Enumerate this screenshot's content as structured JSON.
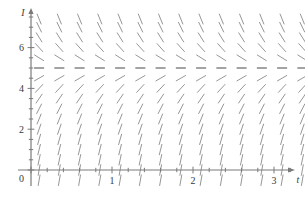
{
  "figure": {
    "name": "slope-field-plot",
    "background_color": "#ffffff",
    "line_color": "#6f6f6f",
    "axis_color": "#7a7a7a",
    "text_color": "#3a3a3a"
  },
  "axes": {
    "x_label": "t",
    "y_label": "I",
    "x_tick_labels": [
      "0",
      "1",
      "2",
      "3"
    ],
    "x_tick_values": [
      0,
      1,
      2,
      3
    ],
    "y_tick_labels": [
      "0",
      "2",
      "4",
      "6"
    ],
    "y_tick_values": [
      0,
      2,
      4,
      6
    ],
    "origin_label": "0",
    "x_minor_tick_count_per_unit": 5,
    "y_minor_tick_count_per_unit": 2
  },
  "chart_data": {
    "type": "scatter",
    "title": "",
    "subtitle": "",
    "xlabel": "t",
    "ylabel": "I",
    "xlim": [
      -0.2,
      3.45
    ],
    "ylim": [
      -0.65,
      7.6
    ],
    "grid": false,
    "legend": "none",
    "equilibrium_value": 5,
    "slope_marks_note": "Each mark is a short line segment centered on a grid point; its angle encodes dI/dt at that I value. Slope depends only on I (autonomous).",
    "x_grid_points": [
      0.1,
      0.35,
      0.6,
      0.85,
      1.1,
      1.35,
      1.6,
      1.85,
      2.1,
      2.35,
      2.6,
      2.85,
      3.1,
      3.35
    ],
    "y_grid_points": [
      -0.5,
      0.0,
      0.5,
      1.0,
      1.5,
      2.0,
      2.5,
      3.0,
      3.5,
      4.0,
      4.5,
      5.0,
      5.5,
      6.0,
      6.5,
      7.0,
      7.4
    ],
    "slope_by_I": [
      {
        "I": -0.5,
        "angle_deg": 80
      },
      {
        "I": 0.0,
        "angle_deg": 80
      },
      {
        "I": 0.5,
        "angle_deg": 78
      },
      {
        "I": 1.0,
        "angle_deg": 76
      },
      {
        "I": 1.5,
        "angle_deg": 74
      },
      {
        "I": 2.0,
        "angle_deg": 71
      },
      {
        "I": 2.5,
        "angle_deg": 68
      },
      {
        "I": 3.0,
        "angle_deg": 63
      },
      {
        "I": 3.5,
        "angle_deg": 56
      },
      {
        "I": 4.0,
        "angle_deg": 47
      },
      {
        "I": 4.5,
        "angle_deg": 30
      },
      {
        "I": 5.0,
        "angle_deg": 0
      },
      {
        "I": 5.5,
        "angle_deg": -32
      },
      {
        "I": 6.0,
        "angle_deg": -48
      },
      {
        "I": 6.5,
        "angle_deg": -58
      },
      {
        "I": 7.0,
        "angle_deg": -64
      },
      {
        "I": 7.4,
        "angle_deg": -68
      }
    ]
  }
}
